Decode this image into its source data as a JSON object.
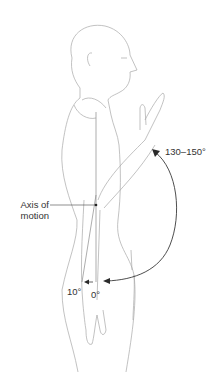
{
  "figure": {
    "labels": {
      "flexion_range": "130–150°",
      "axis": "Axis of motion",
      "axis_line1": "Axis of",
      "axis_line2": "motion",
      "extension": "10°",
      "neutral": "0°"
    },
    "colors": {
      "outline": "#9a9a9a",
      "arrow": "#3a3a3a",
      "text": "#333333",
      "background": "#ffffff"
    }
  }
}
